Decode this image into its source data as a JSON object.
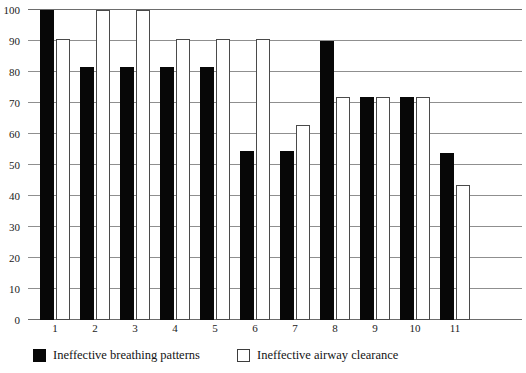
{
  "chart_data": {
    "type": "bar",
    "title": "",
    "subtitle": "",
    "xlabel": "",
    "ylabel": "",
    "ylim": [
      0,
      100
    ],
    "yticks": [
      0,
      10,
      20,
      30,
      40,
      50,
      60,
      70,
      80,
      90,
      100
    ],
    "categories": [
      "1",
      "2",
      "3",
      "4",
      "5",
      "6",
      "7",
      "8",
      "9",
      "10",
      "11"
    ],
    "grid": true,
    "legend_position": "bottom-left",
    "series": [
      {
        "name": "Ineffective breathing patterns",
        "color": "#070707",
        "style": "filled",
        "values": [
          100,
          81.5,
          81.5,
          81.5,
          81.5,
          54.5,
          54.5,
          90,
          72,
          72,
          54
        ]
      },
      {
        "name": "Ineffective airway clearance",
        "color": "#ffffff",
        "style": "hollow",
        "values": [
          90.5,
          100,
          100,
          90.5,
          90.5,
          90.5,
          63,
          72,
          72,
          72,
          43.5
        ]
      }
    ]
  },
  "legend": {
    "items": [
      {
        "label": "Ineffective breathing patterns",
        "swatch": "filled-square"
      },
      {
        "label": "Ineffective airway clearance",
        "swatch": "hollow-square"
      }
    ]
  }
}
